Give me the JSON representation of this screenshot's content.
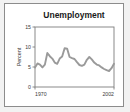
{
  "figure": {
    "background_color": "#f2f2f2",
    "panel_color": "#ffffff",
    "border_color": "#8c8c8c"
  },
  "chart_data": {
    "type": "line",
    "title": "Unemployment",
    "xlabel": "",
    "ylabel": "Percent",
    "xlim": [
      1970,
      2002
    ],
    "ylim": [
      0,
      15
    ],
    "xticks": [
      1970,
      2002
    ],
    "xticklabels": [
      "1970",
      "2002"
    ],
    "yticks": [
      0,
      5,
      10,
      15
    ],
    "yticklabels": [
      "0",
      "5",
      "10",
      "15"
    ],
    "grid": false,
    "legend": false,
    "line_color": "#9a9a9a",
    "line_width": 1.9,
    "x": [
      1970,
      1971,
      1972,
      1973,
      1974,
      1975,
      1976,
      1977,
      1978,
      1979,
      1980,
      1981,
      1982,
      1983,
      1984,
      1985,
      1986,
      1987,
      1988,
      1989,
      1990,
      1991,
      1992,
      1993,
      1994,
      1995,
      1996,
      1997,
      1998,
      1999,
      2000,
      2001,
      2002
    ],
    "values": [
      4.9,
      5.9,
      5.6,
      4.9,
      5.6,
      8.5,
      7.7,
      7.1,
      6.1,
      5.8,
      7.1,
      7.6,
      9.7,
      9.6,
      7.5,
      7.2,
      7.0,
      6.2,
      5.5,
      5.3,
      5.6,
      6.8,
      7.5,
      6.9,
      6.1,
      5.6,
      5.4,
      4.9,
      4.5,
      4.2,
      4.0,
      4.7,
      5.8
    ],
    "series": [
      {
        "name": "Unemployment rate",
        "values": [
          4.9,
          5.9,
          5.6,
          4.9,
          5.6,
          8.5,
          7.7,
          7.1,
          6.1,
          5.8,
          7.1,
          7.6,
          9.7,
          9.6,
          7.5,
          7.2,
          7.0,
          6.2,
          5.5,
          5.3,
          5.6,
          6.8,
          7.5,
          6.9,
          6.1,
          5.6,
          5.4,
          4.9,
          4.5,
          4.2,
          4.0,
          4.7,
          5.8
        ]
      }
    ]
  }
}
